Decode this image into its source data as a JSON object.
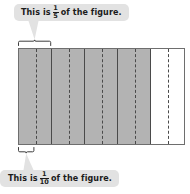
{
  "figure": {
    "label": "partitioned-rectangle",
    "total_parts": 10,
    "major_divisions": 5,
    "minor_divisions_per_major": 2,
    "shaded_parts": 8,
    "unshaded_parts": 2,
    "shaded_fill": "#b3b3b3",
    "unshaded_fill": "#ffffff",
    "outline_color": "#6e6e6e",
    "divider_color": "#4a4a4a",
    "cells": [
      {
        "shaded": true
      },
      {
        "shaded": true
      },
      {
        "shaded": true
      },
      {
        "shaded": true
      },
      {
        "shaded": false
      }
    ]
  },
  "callouts": {
    "top": {
      "prefix": "This is",
      "numerator": "1",
      "denominator": "5",
      "suffix": "of the figure.",
      "bubble_color": "#e2e2e2",
      "points_to": "one-fifth-brace"
    },
    "bottom": {
      "prefix": "This is",
      "numerator": "1",
      "denominator": "10",
      "suffix": "of the figure.",
      "bubble_color": "#e2e2e2",
      "points_to": "one-tenth-brace"
    }
  },
  "braces": {
    "top": {
      "name": "one-fifth-brace",
      "span_parts": 2,
      "position": "above"
    },
    "bottom": {
      "name": "one-tenth-brace",
      "span_parts": 1,
      "position": "below"
    }
  }
}
